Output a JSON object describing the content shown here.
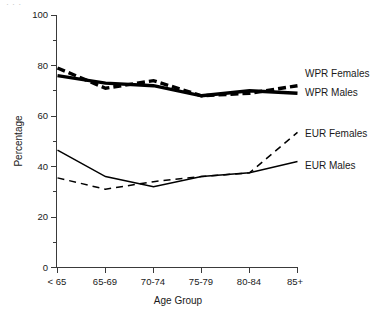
{
  "figure": {
    "top_fragment": "·          ·       ·",
    "background_color": "#ffffff",
    "ink_color": "#000000"
  },
  "axes": {
    "x_title": "Age Group",
    "y_title": "Percentage",
    "x_tick_labels": [
      "< 65",
      "65-69",
      "70-74",
      "75-79",
      "80-84",
      "85+"
    ],
    "y_tick_labels": [
      "0",
      "20",
      "40",
      "60",
      "80",
      "100"
    ]
  },
  "series_labels": {
    "wpr_females": "WPR Females",
    "wpr_males": "WPR Males",
    "eur_females": "EUR Females",
    "eur_males": "EUR Males"
  },
  "chart_data": {
    "type": "line",
    "title": "",
    "xlabel": "Age Group",
    "ylabel": "Percentage",
    "categories": [
      "< 65",
      "65-69",
      "70-74",
      "75-79",
      "80-84",
      "85+"
    ],
    "ylim": [
      0,
      100
    ],
    "yticks": [
      0,
      20,
      40,
      60,
      80,
      100
    ],
    "y_minor_ticks": [
      10,
      30,
      50,
      70,
      90
    ],
    "grid": false,
    "legend_position": "right-inline",
    "series": [
      {
        "name": "WPR Females",
        "style": "dashed",
        "width": "thick",
        "color": "#000000",
        "values": [
          79,
          71,
          74,
          68,
          69,
          72
        ]
      },
      {
        "name": "WPR Males",
        "style": "solid",
        "width": "thick",
        "color": "#000000",
        "values": [
          76,
          73,
          72,
          68,
          70,
          69
        ]
      },
      {
        "name": "EUR Females",
        "style": "dashed",
        "width": "thin",
        "color": "#000000",
        "values": [
          35.5,
          31,
          34,
          36,
          37.5,
          53.5
        ]
      },
      {
        "name": "EUR Males",
        "style": "solid",
        "width": "thin",
        "color": "#000000",
        "values": [
          46.5,
          36,
          32,
          36,
          37.5,
          42
        ]
      }
    ]
  }
}
